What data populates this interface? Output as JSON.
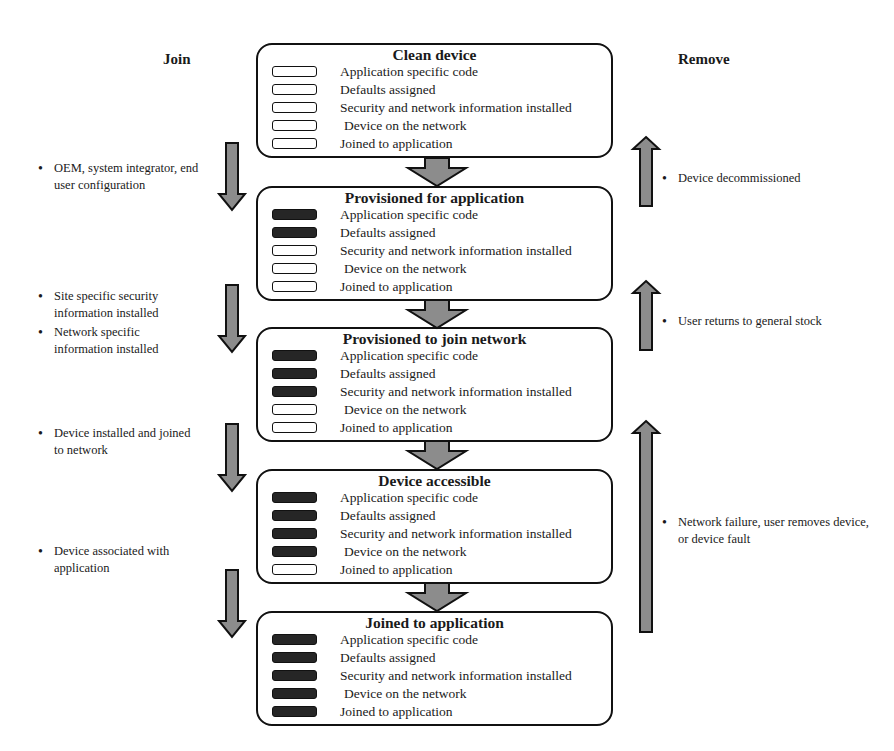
{
  "headers": {
    "join": "Join",
    "remove": "Remove"
  },
  "state_fields": [
    "Application specific code",
    "Defaults assigned",
    "Security and network information installed",
    "Device on the network",
    "Joined to application"
  ],
  "states": [
    {
      "title": "Clean device",
      "filled": [
        false,
        false,
        false,
        false,
        false
      ]
    },
    {
      "title": "Provisioned for application",
      "filled": [
        true,
        true,
        false,
        false,
        false
      ]
    },
    {
      "title": "Provisioned to join network",
      "filled": [
        true,
        true,
        true,
        false,
        false
      ]
    },
    {
      "title": "Device accessible",
      "filled": [
        true,
        true,
        true,
        true,
        false
      ]
    },
    {
      "title": "Joined to application",
      "filled": [
        true,
        true,
        true,
        true,
        true
      ]
    }
  ],
  "join_notes": [
    {
      "bullets": [
        "OEM, system integrator, end user configuration"
      ]
    },
    {
      "bullets": [
        "Site specific security information installed",
        "Network specific information installed"
      ]
    },
    {
      "bullets": [
        "Device installed and joined to network"
      ]
    },
    {
      "bullets": [
        "Device associated with application"
      ]
    }
  ],
  "remove_notes": [
    {
      "bullets": [
        "Device decommissioned"
      ]
    },
    {
      "bullets": [
        "User returns to general stock"
      ]
    },
    {
      "bullets": [
        "Network failure, user removes device, or device fault"
      ]
    }
  ],
  "colors": {
    "arrow_fill": "#8c8c8c",
    "outline": "#111111",
    "indicator_filled": "#262626"
  },
  "bullet_glyph": "•"
}
